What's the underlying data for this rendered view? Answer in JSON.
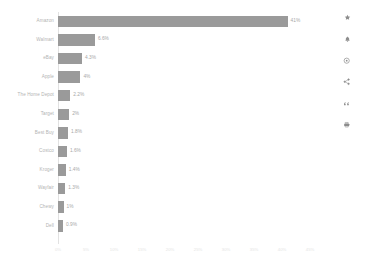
{
  "chart_data": {
    "type": "bar",
    "orientation": "horizontal",
    "title": "",
    "subtitle": "",
    "xlabel": "",
    "ylabel": "",
    "grid": false,
    "legend": "none",
    "bar_color": "#9a9a9a",
    "xlim": [
      0,
      45
    ],
    "categories": [
      "Amazon",
      "Walmart",
      "eBay",
      "Apple",
      "The Home Depot",
      "Target",
      "Best Buy",
      "Costco",
      "Kroger",
      "Wayfair",
      "Chewy",
      "Dell"
    ],
    "values": [
      41,
      6.6,
      4.3,
      4,
      2.2,
      2,
      1.8,
      1.6,
      1.4,
      1.3,
      1,
      0.9
    ],
    "value_labels": [
      "41%",
      "6.6%",
      "4.3%",
      "4%",
      "2.2%",
      "2%",
      "1.8%",
      "1.6%",
      "1.4%",
      "1.3%",
      "1%",
      "0.9%"
    ],
    "x_ticks": [
      0,
      5,
      10,
      15,
      20,
      25,
      30,
      35,
      40,
      45
    ],
    "x_tick_labels": [
      "0%",
      "5%",
      "10%",
      "15%",
      "20%",
      "25%",
      "30%",
      "35%",
      "40%",
      "45%"
    ]
  },
  "toolbar": {
    "icons": [
      {
        "name": "star-icon",
        "title": "Favorite"
      },
      {
        "name": "bell-icon",
        "title": "Alert"
      },
      {
        "name": "gear-icon",
        "title": "Settings"
      },
      {
        "name": "share-icon",
        "title": "Share"
      },
      {
        "name": "quote-icon",
        "title": "Cite"
      },
      {
        "name": "print-icon",
        "title": "Print"
      }
    ]
  }
}
